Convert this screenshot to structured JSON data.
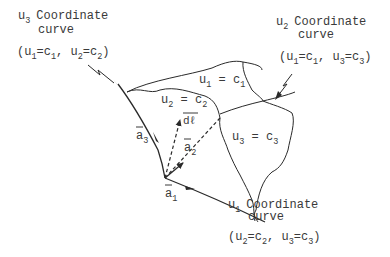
{
  "diagram": {
    "labels": {
      "u3_curve": {
        "var": "u",
        "var_sub": "3",
        "title": "Coordinate",
        "line2": "curve",
        "cond": [
          "u",
          "1",
          "=c",
          "1",
          ", u",
          "2",
          "=c",
          "2"
        ]
      },
      "u2_curve": {
        "var": "u",
        "var_sub": "2",
        "title": "Coordinate",
        "line2": "curve",
        "cond": [
          "u",
          "1",
          "=c",
          "1",
          ", u",
          "3",
          "=c",
          "3"
        ]
      },
      "u1_curve": {
        "var": "u",
        "var_sub": "1",
        "title": "Coordinate",
        "line2": "curve",
        "cond": [
          "u",
          "2",
          "=c",
          "2",
          ", u",
          "3",
          "=c",
          "3"
        ]
      }
    },
    "surfaces": {
      "s1": {
        "var": "u",
        "sub": "1",
        "eq": " = c",
        "csub": "1"
      },
      "s2": {
        "var": "u",
        "sub": "2",
        "eq": " = c",
        "csub": "2"
      },
      "s3": {
        "var": "u",
        "sub": "3",
        "eq": " = c",
        "csub": "3"
      }
    },
    "vectors": {
      "a1": {
        "name": "a",
        "sub": "1"
      },
      "a2": {
        "name": "a",
        "sub": "2"
      },
      "a3": {
        "name": "a",
        "sub": "3"
      },
      "dl": {
        "name": "dℓ"
      }
    }
  }
}
